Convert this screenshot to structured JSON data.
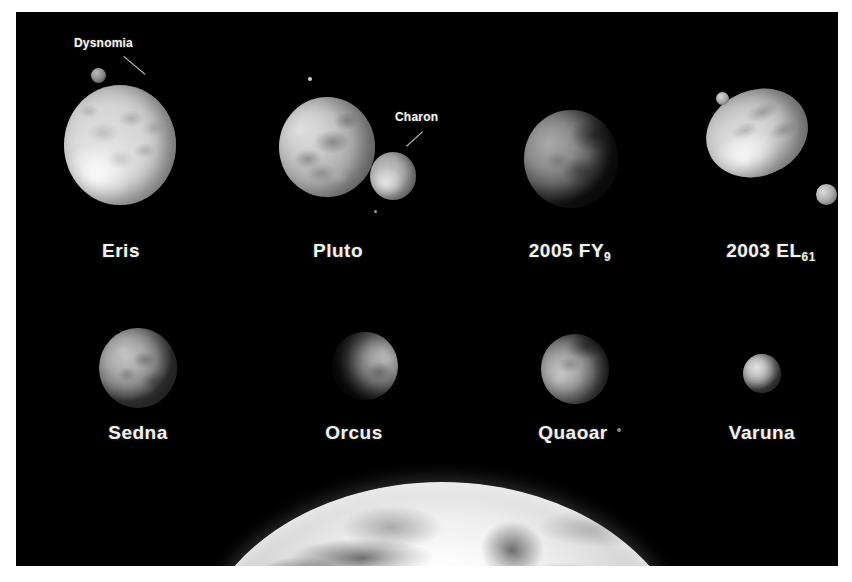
{
  "scene": {
    "background_color": "#000000",
    "page_color": "#ffffff",
    "label_color": "#f2f2f2"
  },
  "row1": {
    "objects": [
      {
        "label": "Eris",
        "name": "eris"
      },
      {
        "label": "Pluto",
        "name": "pluto"
      },
      {
        "label": "2005 FY",
        "subscript": "9",
        "name": "2005-fy9"
      },
      {
        "label": "2003 EL",
        "subscript": "61",
        "name": "2003-el61"
      }
    ]
  },
  "row2": {
    "objects": [
      {
        "label": "Sedna",
        "name": "sedna"
      },
      {
        "label": "Orcus",
        "name": "orcus"
      },
      {
        "label": "Quaoar",
        "name": "quaoar"
      },
      {
        "label": "Varuna",
        "name": "varuna"
      }
    ]
  },
  "callouts": {
    "dysnomia": "Dysnomia",
    "charon": "Charon"
  },
  "earth": {
    "name": "earth-limb"
  }
}
